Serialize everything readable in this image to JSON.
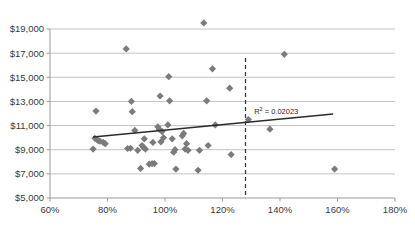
{
  "chart_data": {
    "type": "scatter",
    "title": "",
    "subtitle": "",
    "xlabel": "",
    "ylabel": "",
    "xlim": [
      60,
      180
    ],
    "ylim": [
      5000,
      19000
    ],
    "grid": true,
    "legend": false,
    "legend_position": "none",
    "x_tick_labels": [
      "60%",
      "80%",
      "100%",
      "120%",
      "140%",
      "160%",
      "180%"
    ],
    "x_tick_values": [
      60,
      80,
      100,
      120,
      140,
      160,
      180
    ],
    "y_tick_labels": [
      "$5,000",
      "$7,000",
      "$9,000",
      "$11,000",
      "$13,000",
      "$15,000",
      "$17,000",
      "$19,000"
    ],
    "y_tick_values": [
      5000,
      7000,
      9000,
      11000,
      13000,
      15000,
      17000,
      19000
    ],
    "marker_shape": "diamond",
    "marker_color": "#7b7b7b",
    "series": [
      {
        "name": "observations",
        "points": [
          [
            75.0,
            9050
          ],
          [
            75.6,
            9950
          ],
          [
            76.2,
            9850
          ],
          [
            76.8,
            9750
          ],
          [
            77.4,
            9700
          ],
          [
            76.0,
            12200
          ],
          [
            78.5,
            9600
          ],
          [
            79.2,
            9500
          ],
          [
            86.5,
            17350
          ],
          [
            87.0,
            9100
          ],
          [
            88.0,
            9120
          ],
          [
            88.3,
            13000
          ],
          [
            88.6,
            12150
          ],
          [
            89.5,
            10600
          ],
          [
            90.5,
            8950
          ],
          [
            91.5,
            7450
          ],
          [
            92.0,
            9350
          ],
          [
            92.5,
            9200
          ],
          [
            92.8,
            9900
          ],
          [
            93.2,
            9050
          ],
          [
            94.5,
            7800
          ],
          [
            95.5,
            7850
          ],
          [
            95.8,
            9600
          ],
          [
            96.3,
            7850
          ],
          [
            97.5,
            10900
          ],
          [
            98.0,
            10700
          ],
          [
            98.3,
            13450
          ],
          [
            98.6,
            9650
          ],
          [
            99.0,
            10500
          ],
          [
            99.5,
            10000
          ],
          [
            101.0,
            11050
          ],
          [
            101.3,
            15050
          ],
          [
            101.6,
            13050
          ],
          [
            102.5,
            9900
          ],
          [
            103.0,
            8800
          ],
          [
            103.5,
            9000
          ],
          [
            103.8,
            7400
          ],
          [
            106.0,
            10150
          ],
          [
            106.5,
            10350
          ],
          [
            107.0,
            9050
          ],
          [
            107.5,
            9500
          ],
          [
            108.0,
            8950
          ],
          [
            111.5,
            7300
          ],
          [
            112.0,
            8950
          ],
          [
            113.5,
            19500
          ],
          [
            114.5,
            13050
          ],
          [
            115.0,
            9350
          ],
          [
            116.5,
            15700
          ],
          [
            117.5,
            11050
          ],
          [
            122.5,
            14100
          ],
          [
            123.0,
            8600
          ],
          [
            129.0,
            11500
          ],
          [
            136.5,
            10700
          ],
          [
            141.5,
            16900
          ],
          [
            159.0,
            7400
          ]
        ]
      }
    ],
    "trendline": {
      "x_start": 75.0,
      "y_start": 10050,
      "x_end": 158.5,
      "y_end": 11950,
      "color": "#2a2a2a"
    },
    "annotations": [
      {
        "name": "r-squared",
        "text": "R² = 0.02023",
        "x": 131.0,
        "y": 11950
      }
    ],
    "reference_lines": [
      {
        "name": "threshold",
        "orientation": "vertical",
        "value": 128.0,
        "style": "dashed",
        "y_top": 16600,
        "y_bottom": 5000
      }
    ]
  }
}
